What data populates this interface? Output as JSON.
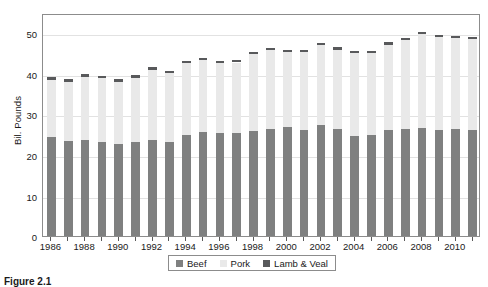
{
  "caption": "Figure 2.1",
  "axis": {
    "y_title": "Bil. Pounds",
    "y_ticks": [
      "0",
      "10",
      "20",
      "30",
      "40",
      "50"
    ],
    "x_ticks": [
      "1986",
      "1988",
      "1990",
      "1992",
      "1994",
      "1996",
      "1998",
      "2000",
      "2002",
      "2004",
      "2006",
      "2008",
      "2010"
    ]
  },
  "legend": {
    "items": [
      {
        "label": "Beef",
        "color": "#7f8080"
      },
      {
        "label": "Pork",
        "color": "#e9e9e9"
      },
      {
        "label": "Lamb & Veal",
        "color": "#58595b"
      }
    ]
  },
  "chart_data": {
    "type": "bar",
    "stacked": true,
    "title": "",
    "xlabel": "",
    "ylabel": "Bil. Pounds",
    "ylim": [
      0,
      55
    ],
    "ytick_values": [
      0,
      10,
      20,
      30,
      40,
      50
    ],
    "grid": true,
    "legend_position": "bottom",
    "categories": [
      "1986",
      "1987",
      "1988",
      "1989",
      "1990",
      "1991",
      "1992",
      "1993",
      "1994",
      "1995",
      "1996",
      "1997",
      "1998",
      "1999",
      "2000",
      "2001",
      "2002",
      "2003",
      "2004",
      "2005",
      "2006",
      "2007",
      "2008",
      "2009",
      "2010",
      "2011"
    ],
    "series": [
      {
        "name": "Beef",
        "color": "#7f8080",
        "values": [
          24.5,
          23.4,
          23.6,
          23.1,
          22.7,
          23.1,
          23.8,
          23.2,
          24.9,
          25.6,
          25.5,
          25.5,
          25.8,
          26.5,
          26.9,
          26.2,
          27.3,
          26.3,
          24.6,
          24.8,
          26.2,
          26.4,
          26.6,
          26.1,
          26.4,
          26.1
        ],
        "unit": "billion pounds"
      },
      {
        "name": "Pork",
        "color": "#e9e9e9",
        "values": [
          14.0,
          14.7,
          15.7,
          15.8,
          15.4,
          15.9,
          17.2,
          17.0,
          17.7,
          17.8,
          17.1,
          17.3,
          19.0,
          19.3,
          18.5,
          19.1,
          19.7,
          19.7,
          20.5,
          20.3,
          21.0,
          21.9,
          23.3,
          23.0,
          22.4,
          22.5
        ],
        "unit": "billion pounds"
      },
      {
        "name": "Lamb & Veal",
        "color": "#58595b",
        "values": [
          0.7,
          0.6,
          0.6,
          0.6,
          0.6,
          0.6,
          0.6,
          0.6,
          0.6,
          0.6,
          0.6,
          0.5,
          0.5,
          0.5,
          0.5,
          0.5,
          0.5,
          0.5,
          0.5,
          0.5,
          0.5,
          0.5,
          0.5,
          0.5,
          0.5,
          0.5
        ],
        "unit": "billion pounds"
      }
    ],
    "totals": [
      39.2,
      38.7,
      39.9,
      39.5,
      38.7,
      39.6,
      41.6,
      40.8,
      43.2,
      44.0,
      43.2,
      43.3,
      45.3,
      46.3,
      45.9,
      45.8,
      47.5,
      46.5,
      45.6,
      45.6,
      47.7,
      48.8,
      50.4,
      49.6,
      49.3,
      49.1
    ]
  }
}
